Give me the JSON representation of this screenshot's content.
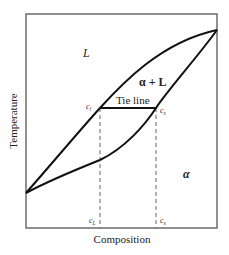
{
  "diagram": {
    "type": "binary-phase-diagram",
    "axes": {
      "xlabel": "Composition",
      "ylabel": "Temperature"
    },
    "regions": {
      "liquid": "L",
      "two_phase": "α + L",
      "solid": "α"
    },
    "tie_line": {
      "label": "Tie line",
      "left_label": "c",
      "left_sub": "l",
      "right_label": "c",
      "right_sub": "s"
    },
    "bottom_marks": {
      "left_label": "c",
      "left_sub": "L",
      "right_label": "c",
      "right_sub": "s"
    },
    "colors": {
      "line": "#111111",
      "frame": "#555555",
      "dashed": "#666666",
      "text": "#222222"
    }
  }
}
